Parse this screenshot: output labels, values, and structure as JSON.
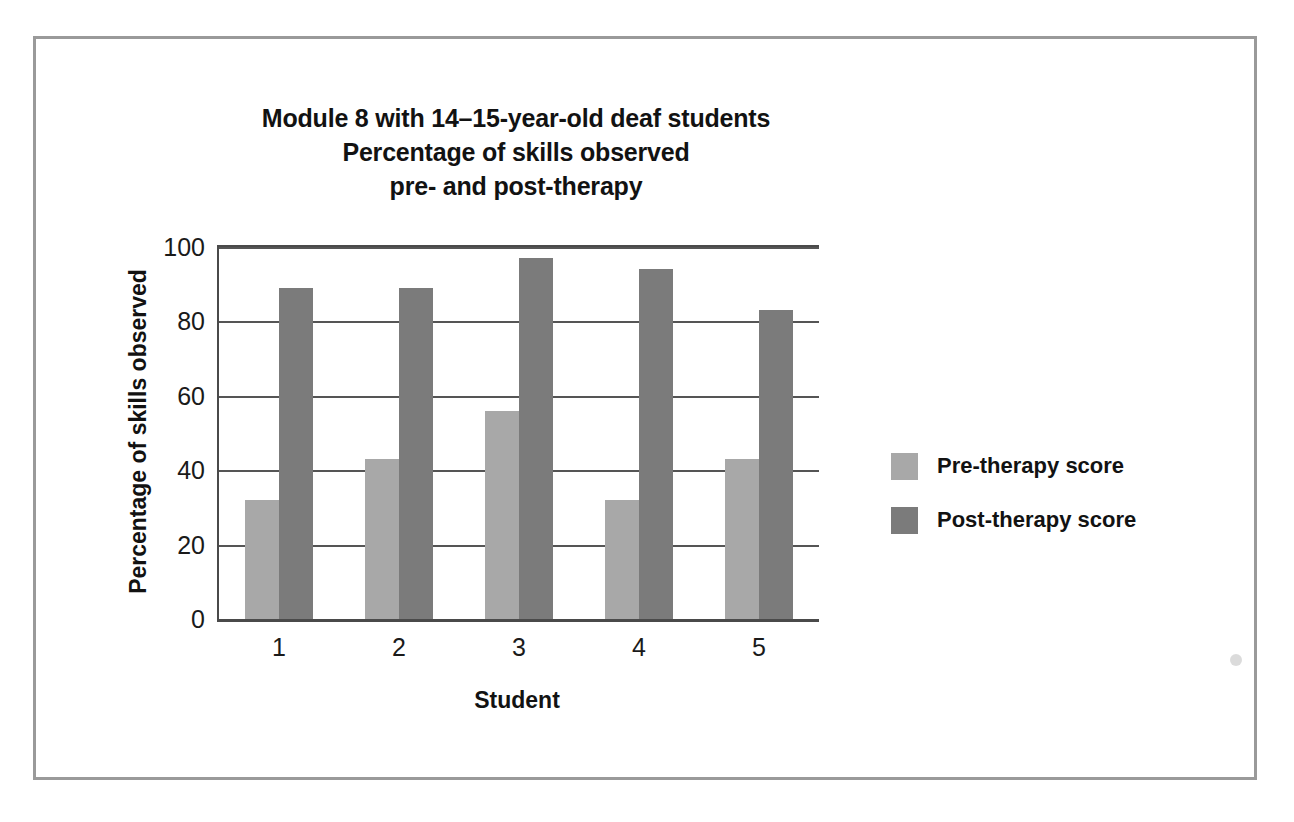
{
  "figure": {
    "title_lines": [
      "Module 8 with 14–15-year-old deaf students",
      "Percentage of skills observed",
      "pre- and post-therapy"
    ],
    "border_color": "#9a9a9a",
    "background": "#ffffff"
  },
  "legend": {
    "position": "right",
    "entries": [
      {
        "label": "Pre-therapy score",
        "color": "#a8a8a8"
      },
      {
        "label": "Post-therapy score",
        "color": "#7b7b7b"
      }
    ]
  },
  "axes": {
    "x_title": "Student",
    "y_title": "Percentage of skills observed",
    "y_ticks": [
      "0",
      "20",
      "40",
      "60",
      "80",
      "100"
    ],
    "x_ticks": [
      "1",
      "2",
      "3",
      "4",
      "5"
    ]
  },
  "chart_data": {
    "type": "bar",
    "title": "Module 8 with 14–15-year-old deaf students Percentage of skills observed pre- and post-therapy",
    "xlabel": "Student",
    "ylabel": "Percentage of skills observed",
    "categories": [
      "1",
      "2",
      "3",
      "4",
      "5"
    ],
    "series": [
      {
        "name": "Pre-therapy score",
        "color": "#a8a8a8",
        "values": [
          32,
          43,
          56,
          32,
          43
        ]
      },
      {
        "name": "Post-therapy score",
        "color": "#7b7b7b",
        "values": [
          89,
          89,
          97,
          94,
          83
        ]
      }
    ],
    "ylim": [
      0,
      100
    ],
    "ytick_values": [
      0,
      20,
      40,
      60,
      80,
      100
    ],
    "grid": "horizontal",
    "legend_position": "right"
  }
}
